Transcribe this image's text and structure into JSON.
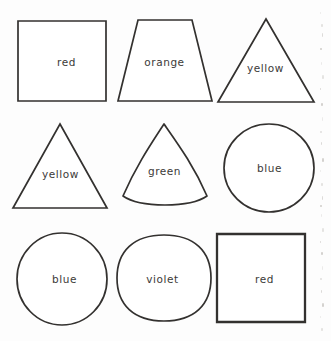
{
  "page": {
    "background_color": "#fdfdfd",
    "stroke_color": "#33312f",
    "text_color": "#3c3a38",
    "columns": 3,
    "rows": 3
  },
  "shapes": [
    {
      "label": "red",
      "shape": "square",
      "row": 1,
      "col": 1
    },
    {
      "label": "orange",
      "shape": "trapezoid",
      "row": 1,
      "col": 2
    },
    {
      "label": "yellow",
      "shape": "triangle",
      "row": 1,
      "col": 3
    },
    {
      "label": "yellow",
      "shape": "triangle",
      "row": 2,
      "col": 1
    },
    {
      "label": "green",
      "shape": "reuleaux-triangle",
      "row": 2,
      "col": 2
    },
    {
      "label": "blue",
      "shape": "circle",
      "row": 2,
      "col": 3
    },
    {
      "label": "blue",
      "shape": "circle",
      "row": 3,
      "col": 1
    },
    {
      "label": "violet",
      "shape": "rounded-oval",
      "row": 3,
      "col": 2
    },
    {
      "label": "red",
      "shape": "square",
      "row": 3,
      "col": 3
    }
  ]
}
